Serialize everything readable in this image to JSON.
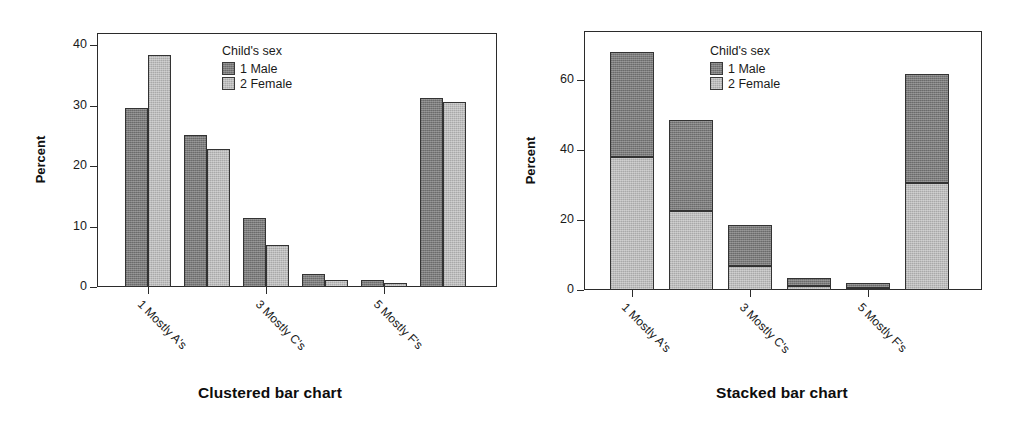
{
  "figure": {
    "background": "#ffffff",
    "colors": {
      "male": "#7b7b7b",
      "female": "#bcbcbc",
      "axis": "#2b2b2b",
      "text": "#1a1a1a"
    }
  },
  "legend": {
    "title": "Child's sex",
    "entries": [
      {
        "label": "1 Male",
        "color": "#7b7b7b",
        "swatch": "male-swatch"
      },
      {
        "label": "2 Female",
        "color": "#bcbcbc",
        "swatch": "female-swatch"
      }
    ]
  },
  "panels": [
    {
      "caption": "Clustered bar chart"
    },
    {
      "caption": "Stacked bar chart"
    }
  ],
  "chart_data": [
    {
      "type": "bar",
      "subtype": "clustered",
      "title": "Clustered bar chart",
      "xlabel": "",
      "ylabel": "Percent",
      "ylim": [
        0,
        42
      ],
      "yticks": [
        0,
        10,
        20,
        30,
        40
      ],
      "ytick_labels": [
        "0",
        "10",
        "20",
        "30",
        "40"
      ],
      "grid": false,
      "legend_position": "inside-top-center",
      "categories": [
        "1 Mostly A's",
        "2 Mostly B's",
        "3 Mostly C's",
        "4 Mostly D's",
        "5 Mostly F's",
        "6 Ungraded"
      ],
      "visible_xtick_labels": [
        "1 Mostly A's",
        "3 Mostly C's",
        "5 Mostly F's"
      ],
      "series": [
        {
          "name": "1 Male",
          "color": "#7b7b7b",
          "values": [
            29.6,
            25.1,
            11.4,
            2.2,
            1.2,
            31.2
          ]
        },
        {
          "name": "2 Female",
          "color": "#bcbcbc",
          "values": [
            38.4,
            22.8,
            7.0,
            1.2,
            0.6,
            30.6
          ]
        }
      ]
    },
    {
      "type": "bar",
      "subtype": "stacked",
      "title": "Stacked bar chart",
      "xlabel": "",
      "ylabel": "Percent",
      "ylim": [
        0,
        74
      ],
      "yticks": [
        0,
        20,
        40,
        60
      ],
      "ytick_labels": [
        "0",
        "20",
        "40",
        "60"
      ],
      "grid": false,
      "legend_position": "inside-top-center",
      "categories": [
        "1 Mostly A's",
        "2 Mostly B's",
        "3 Mostly C's",
        "4 Mostly D's",
        "5 Mostly F's",
        "6 Ungraded"
      ],
      "visible_xtick_labels": [
        "1 Mostly A's",
        "3 Mostly C's",
        "5 Mostly F's"
      ],
      "series": [
        {
          "name": "2 Female",
          "color": "#bcbcbc",
          "values": [
            38.0,
            22.5,
            7.0,
            1.2,
            0.6,
            30.5
          ]
        },
        {
          "name": "1 Male",
          "color": "#7b7b7b",
          "values": [
            30.0,
            26.0,
            11.5,
            2.2,
            1.3,
            31.3
          ]
        }
      ],
      "totals": [
        68.0,
        48.5,
        18.5,
        3.4,
        1.9,
        61.8
      ]
    }
  ]
}
